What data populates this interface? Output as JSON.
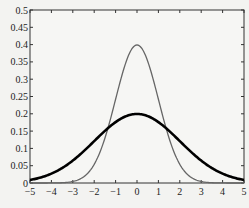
{
  "chart_data": {
    "type": "line",
    "title": "",
    "xlabel": "",
    "ylabel": "",
    "xlim": [
      -5,
      5
    ],
    "ylim": [
      0,
      0.5
    ],
    "grid": false,
    "legend": null,
    "x_ticks": [
      "-5",
      "-4",
      "-3",
      "-2",
      "-1",
      "0",
      "1",
      "2",
      "3",
      "4",
      "5"
    ],
    "y_ticks": [
      "0",
      "0.05",
      "0.1",
      "0.15",
      "0.2",
      "0.25",
      "0.3",
      "0.35",
      "0.4",
      "0.45",
      "0.5"
    ],
    "series": [
      {
        "name": "Normal PDF, mean 0, sd 1",
        "color": "#666666",
        "line_width": 1.3,
        "x": [
          -5,
          -4,
          -3,
          -2.5,
          -2,
          -1.5,
          -1,
          -0.5,
          0,
          0.5,
          1,
          1.5,
          2,
          2.5,
          3,
          4,
          5
        ],
        "values": [
          0.0,
          0.0001,
          0.0044,
          0.0175,
          0.054,
          0.1295,
          0.242,
          0.3521,
          0.3989,
          0.3521,
          0.242,
          0.1295,
          0.054,
          0.0175,
          0.0044,
          0.0001,
          0.0
        ]
      },
      {
        "name": "Normal PDF, mean 0, sd 2",
        "color": "#000000",
        "line_width": 2.6,
        "x": [
          -5,
          -4,
          -3,
          -2.5,
          -2,
          -1.5,
          -1,
          -0.5,
          0,
          0.5,
          1,
          1.5,
          2,
          2.5,
          3,
          4,
          5
        ],
        "values": [
          0.0088,
          0.027,
          0.0648,
          0.0913,
          0.121,
          0.1506,
          0.176,
          0.1933,
          0.1995,
          0.1933,
          0.176,
          0.1506,
          0.121,
          0.0913,
          0.0648,
          0.027,
          0.0088
        ]
      }
    ]
  }
}
